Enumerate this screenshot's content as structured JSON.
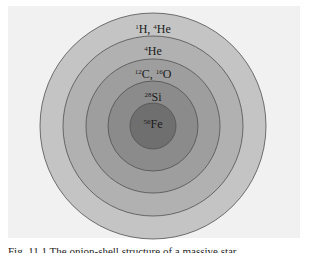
{
  "figure": {
    "background": "#f1f1f1",
    "center": {
      "x": 153,
      "y": 126
    },
    "shells": [
      {
        "name": "hydrogen-helium-envelope",
        "radius": 113,
        "fill": "#c4c4c4",
        "label_mass1": "1",
        "label_el1": "H, ",
        "label_mass2": "4",
        "label_el2": "He",
        "label_y": 31
      },
      {
        "name": "helium-shell",
        "radius": 90,
        "fill": "#b1b1b1",
        "label_mass1": "4",
        "label_el1": "He",
        "label_mass2": "",
        "label_el2": "",
        "label_y": 53
      },
      {
        "name": "carbon-oxygen-shell",
        "radius": 67,
        "fill": "#9e9e9e",
        "label_mass1": "12",
        "label_el1": "C, ",
        "label_mass2": "16",
        "label_el2": "O",
        "label_y": 77
      },
      {
        "name": "silicon-shell",
        "radius": 45,
        "fill": "#8b8b8b",
        "label_mass1": "28",
        "label_el1": "Si",
        "label_mass2": "",
        "label_el2": "",
        "label_y": 99
      },
      {
        "name": "iron-core",
        "radius": 23,
        "fill": "#6f6f6f",
        "label_mass1": "56",
        "label_el1": "Fe",
        "label_mass2": "",
        "label_el2": "",
        "label_y": 127
      }
    ],
    "stroke": "#505050"
  },
  "labels": {
    "shell1": {
      "mass1": "1",
      "el1": "H,",
      "mass2": "4",
      "el2": "He"
    },
    "shell2": {
      "mass1": "4",
      "el1": "He"
    },
    "shell3": {
      "mass1": "12",
      "el1": "C,",
      "mass2": "16",
      "el2": "O"
    },
    "shell4": {
      "mass1": "28",
      "el1": "Si"
    },
    "core": {
      "mass1": "56",
      "el1": "Fe"
    }
  },
  "caption": "Fig. 11.1  The onion-shell structure of a massive star"
}
